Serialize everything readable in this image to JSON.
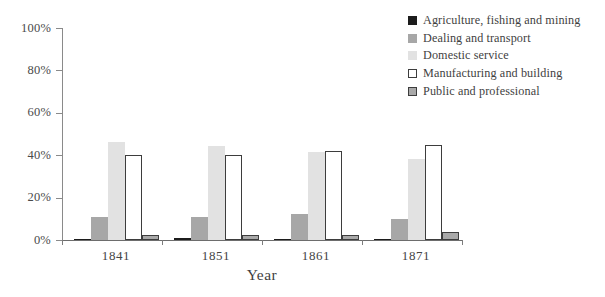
{
  "chart_data": {
    "type": "bar",
    "title": "",
    "subtitle": "",
    "xlabel": "Year",
    "ylabel": "",
    "categories": [
      "1841",
      "1851",
      "1861",
      "1871"
    ],
    "ylim": [
      0,
      100
    ],
    "yticks": [
      0,
      20,
      40,
      60,
      80,
      100
    ],
    "ytick_labels": [
      "0%",
      "20%",
      "40%",
      "60%",
      "80%",
      "100%"
    ],
    "grid": false,
    "legend_position": "top-right",
    "units": "percent",
    "series": [
      {
        "name": "Agriculture, fishing and mining",
        "color": "#1c1c1c",
        "style": "solid-fill",
        "values": [
          0.2,
          1.0,
          0.3,
          0.3
        ]
      },
      {
        "name": "Dealing and transport",
        "color": "#a7a7a7",
        "style": "solid-fill",
        "values": [
          11.0,
          11.0,
          12.5,
          10.0
        ]
      },
      {
        "name": "Domestic service",
        "color": "#e2e2e2",
        "style": "solid-fill",
        "values": [
          46.0,
          44.5,
          41.5,
          38.0
        ]
      },
      {
        "name": "Manufacturing and building",
        "color": "#ffffff",
        "style": "outlined",
        "values": [
          40.0,
          40.0,
          42.0,
          45.0
        ]
      },
      {
        "name": "Public and professional",
        "color": "#a9a9a9",
        "style": "outlined-fill",
        "values": [
          2.5,
          2.5,
          2.5,
          4.0
        ]
      }
    ]
  },
  "legend": {
    "items": [
      {
        "label": "Agriculture, fishing and mining"
      },
      {
        "label": "Dealing and transport"
      },
      {
        "label": "Domestic service"
      },
      {
        "label": "Manufacturing and building"
      },
      {
        "label": "Public and professional"
      }
    ]
  }
}
